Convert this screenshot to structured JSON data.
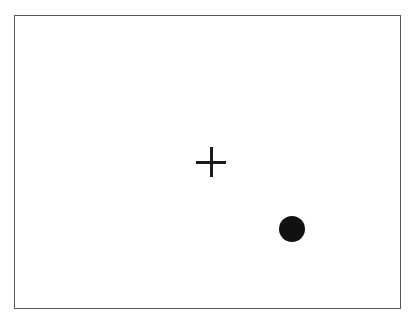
{
  "display": {
    "frame": {
      "left": 14,
      "top": 15,
      "width": 385,
      "height": 292,
      "border_color": "#555555",
      "background": "#ffffff"
    },
    "fixation_cross": {
      "symbol": "+",
      "center_x": 211,
      "center_y": 162,
      "size": 30,
      "stroke": 3,
      "color": "#1a1a1a"
    },
    "target_dot": {
      "shape": "circle",
      "center_x": 292,
      "center_y": 229,
      "diameter": 26,
      "color": "#111111"
    }
  }
}
